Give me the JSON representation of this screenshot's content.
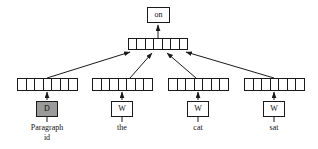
{
  "figure": {
    "type": "neural-network-architecture-diagram",
    "name": "Paragraph Vector Distributed Memory (PV-DM)"
  },
  "output": {
    "label": "on"
  },
  "hidden": {
    "name": "concatenation-layer",
    "cells": 7
  },
  "columns": [
    {
      "id": "paragraph",
      "vector_cells": 7,
      "matrix_label": "D",
      "matrix_shaded": true,
      "caption": "Paragraph\nid",
      "caption_line1": "Paragraph",
      "caption_line2": "id"
    },
    {
      "id": "word-the",
      "vector_cells": 7,
      "matrix_label": "W",
      "matrix_shaded": false,
      "caption": "the",
      "caption_line1": "the",
      "caption_line2": ""
    },
    {
      "id": "word-cat",
      "vector_cells": 7,
      "matrix_label": "W",
      "matrix_shaded": false,
      "caption": "cat",
      "caption_line1": "cat",
      "caption_line2": ""
    },
    {
      "id": "word-sat",
      "vector_cells": 7,
      "matrix_label": "W",
      "matrix_shaded": false,
      "caption": "sat",
      "caption_line1": "sat",
      "caption_line2": ""
    }
  ],
  "colors": {
    "stroke": "#1a1a1a",
    "shaded_fill": "#9a9a9a",
    "background": "#ffffff",
    "text": "#111111"
  }
}
